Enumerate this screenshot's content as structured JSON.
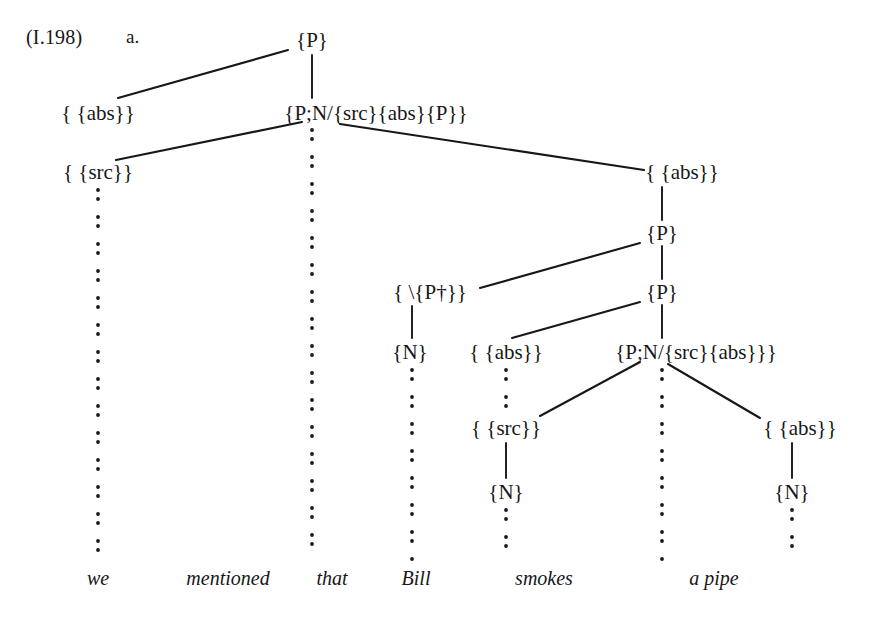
{
  "figure": {
    "example_ref": "(I.198)",
    "item_letter": "a.",
    "ink_color": "#171717",
    "background_color": "#ffffff",
    "sentence": "we mentioned that Bill smokes a pipe",
    "words": [
      {
        "text": "we",
        "x": 98,
        "y": 578
      },
      {
        "text": "mentioned",
        "x": 228,
        "y": 578
      },
      {
        "text": "that",
        "x": 332,
        "y": 578
      },
      {
        "text": "Bill",
        "x": 416,
        "y": 578
      },
      {
        "text": "smokes",
        "x": 544,
        "y": 578
      },
      {
        "text": "a pipe",
        "x": 714,
        "y": 578
      }
    ],
    "nodes": [
      {
        "id": "n1",
        "label": "{P}",
        "x": 312,
        "y": 40
      },
      {
        "id": "n2",
        "label": "{P;N/{src}{abs}{P}}",
        "x": 376,
        "y": 113
      },
      {
        "id": "n3",
        "label": "{ {abs}}",
        "x": 98,
        "y": 113
      },
      {
        "id": "n4",
        "label": "{ {src}}",
        "x": 98,
        "y": 172
      },
      {
        "id": "n5",
        "label": "{ {abs}}",
        "x": 682,
        "y": 172
      },
      {
        "id": "n6",
        "label": "{P}",
        "x": 662,
        "y": 233
      },
      {
        "id": "n7",
        "label": "{P}",
        "x": 662,
        "y": 292
      },
      {
        "id": "n8",
        "label": "{ \\{P†}}",
        "x": 430,
        "y": 292
      },
      {
        "id": "n9",
        "label": "{N}",
        "x": 410,
        "y": 352
      },
      {
        "id": "n10",
        "label": "{ {abs}}",
        "x": 506,
        "y": 352
      },
      {
        "id": "n11",
        "label": "{P;N/{src}{abs}}}",
        "x": 696,
        "y": 352
      },
      {
        "id": "n12",
        "label": "{ {src}}",
        "x": 506,
        "y": 428
      },
      {
        "id": "n13",
        "label": "{ {abs}}",
        "x": 800,
        "y": 428
      },
      {
        "id": "n14",
        "label": "{N}",
        "x": 506,
        "y": 492
      },
      {
        "id": "n15",
        "label": "{N}",
        "x": 792,
        "y": 492
      }
    ],
    "edges": [
      {
        "type": "diagonal",
        "from": "n1",
        "to": "n3",
        "x1": 288,
        "y1": 50,
        "x2": 118,
        "y2": 98
      },
      {
        "type": "vertical",
        "from": "n1",
        "to": "n2",
        "x1": 312,
        "y1": 55,
        "x2": 312,
        "y2": 98
      },
      {
        "type": "diagonal",
        "from": "n2",
        "to": "n4",
        "x1": 302,
        "y1": 122,
        "x2": 116,
        "y2": 160
      },
      {
        "type": "diagonal",
        "from": "n2",
        "to": "n5",
        "x1": 340,
        "y1": 124,
        "x2": 644,
        "y2": 170
      },
      {
        "type": "vertical",
        "from": "n5",
        "to": "n6",
        "x1": 662,
        "y1": 187,
        "x2": 662,
        "y2": 220
      },
      {
        "type": "vertical",
        "from": "n6",
        "to": "n7",
        "x1": 662,
        "y1": 246,
        "x2": 662,
        "y2": 279
      },
      {
        "type": "diagonal",
        "from": "n6",
        "to": "n8",
        "x1": 640,
        "y1": 243,
        "x2": 480,
        "y2": 288
      },
      {
        "type": "diagonal",
        "from": "n7",
        "to": "n10",
        "x1": 640,
        "y1": 302,
        "x2": 512,
        "y2": 338
      },
      {
        "type": "vertical",
        "from": "n7",
        "to": "n11",
        "x1": 662,
        "y1": 305,
        "x2": 662,
        "y2": 338
      },
      {
        "type": "vertical",
        "from": "n8",
        "to": "n9",
        "x1": 412,
        "y1": 306,
        "x2": 412,
        "y2": 338
      },
      {
        "type": "diagonal",
        "from": "n11",
        "to": "n12",
        "x1": 640,
        "y1": 362,
        "x2": 540,
        "y2": 416
      },
      {
        "type": "diagonal",
        "from": "n11",
        "to": "n13",
        "x1": 668,
        "y1": 364,
        "x2": 760,
        "y2": 418
      },
      {
        "type": "vertical",
        "from": "n12",
        "to": "n14",
        "x1": 506,
        "y1": 443,
        "x2": 506,
        "y2": 478
      },
      {
        "type": "vertical",
        "from": "n13",
        "to": "n15",
        "x1": 792,
        "y1": 443,
        "x2": 792,
        "y2": 478
      }
    ],
    "dotted_columns": [
      {
        "name": "we-column",
        "x": 98,
        "y1": 190,
        "y2": 560
      },
      {
        "name": "mentioned-column",
        "x": 312,
        "y1": 130,
        "y2": 560
      },
      {
        "name": "that-column",
        "x": 412,
        "y1": 370,
        "y2": 560
      },
      {
        "name": "bill-column",
        "x": 506,
        "y1": 510,
        "y2": 560
      },
      {
        "name": "bill-mid-column",
        "x": 506,
        "y1": 370,
        "y2": 412
      },
      {
        "name": "smokes-column",
        "x": 662,
        "y1": 370,
        "y2": 560
      },
      {
        "name": "a-pipe-column",
        "x": 792,
        "y1": 510,
        "y2": 560
      }
    ]
  }
}
